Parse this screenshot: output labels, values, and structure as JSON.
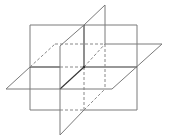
{
  "diagram": {
    "title": "",
    "colors": {
      "line": "#7a7a7a",
      "dark_line": "#333333",
      "dashed_line": "#888888",
      "background": "#ffffff"
    },
    "planes": [
      {
        "name": "frontal-plane",
        "shape": "rectangle",
        "points": [
          [
            30,
            25
          ],
          [
            137,
            25
          ],
          [
            137,
            110
          ],
          [
            30,
            110
          ]
        ]
      },
      {
        "name": "horizontal-plane",
        "shape": "parallelogram",
        "points": [
          [
            55,
            44
          ],
          [
            162,
            44
          ],
          [
            112,
            89
          ],
          [
            6,
            89
          ]
        ]
      },
      {
        "name": "profile-plane",
        "shape": "parallelogram",
        "points": [
          [
            105,
            5
          ],
          [
            60,
            46
          ],
          [
            60,
            135
          ],
          [
            105,
            94
          ]
        ]
      }
    ],
    "intersection_point": [
      84,
      67
    ]
  }
}
